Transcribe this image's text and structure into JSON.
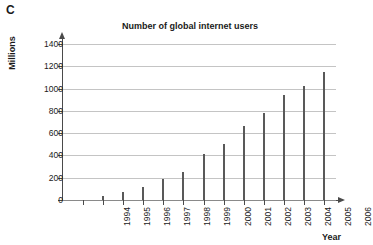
{
  "panel": {
    "letter": "C"
  },
  "axis_titles": {
    "y": "Millions",
    "x": "Year"
  },
  "colors": {
    "bar": "#595959",
    "gridline": "#c4c4c4",
    "axis": "#4a4a4a",
    "background": "#ffffff",
    "text": "#1a1a1a"
  },
  "chart_data": {
    "type": "bar",
    "title": "Number of global internet users",
    "xlabel": "Year",
    "ylabel": "Millions",
    "categories": [
      "1994",
      "1995",
      "1996",
      "1997",
      "1998",
      "1999",
      "2000",
      "2001",
      "2002",
      "2003",
      "2004",
      "2005",
      "2006"
    ],
    "values": [
      0,
      40,
      75,
      120,
      185,
      250,
      410,
      500,
      660,
      780,
      940,
      1020,
      1150
    ],
    "ylim": [
      0,
      1400
    ],
    "ytick_values": [
      0,
      200,
      400,
      600,
      800,
      1000,
      1200,
      1400
    ],
    "ytick_labels": [
      "0",
      "200",
      "400",
      "600",
      "800",
      "1000",
      "1200",
      "1400"
    ],
    "grid": true,
    "legend": null
  }
}
